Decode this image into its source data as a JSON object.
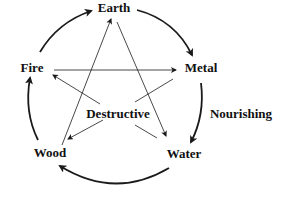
{
  "diagram": {
    "type": "five-elements-cycle",
    "nodes": [
      {
        "id": "earth",
        "label": "Earth",
        "x": 114,
        "y": 8
      },
      {
        "id": "fire",
        "label": "Fire",
        "x": 32,
        "y": 68
      },
      {
        "id": "metal",
        "label": "Metal",
        "x": 201,
        "y": 68
      },
      {
        "id": "wood",
        "label": "Wood",
        "x": 50,
        "y": 153
      },
      {
        "id": "water",
        "label": "Water",
        "x": 184,
        "y": 154
      }
    ],
    "cycle_labels": {
      "destructive": "Destructive",
      "nourishing": "Nourishing"
    },
    "nourishing_edges": [
      {
        "from": "Fire",
        "to": "Earth"
      },
      {
        "from": "Earth",
        "to": "Metal"
      },
      {
        "from": "Metal",
        "to": "Water"
      },
      {
        "from": "Water",
        "to": "Wood"
      },
      {
        "from": "Wood",
        "to": "Fire"
      }
    ],
    "destructive_edges": [
      {
        "from": "Fire",
        "to": "Metal"
      },
      {
        "from": "Metal",
        "to": "Wood"
      },
      {
        "from": "Wood",
        "to": "Earth"
      },
      {
        "from": "Earth",
        "to": "Water"
      },
      {
        "from": "Water",
        "to": "Fire"
      }
    ],
    "colors": {
      "line": "#1a1a1a",
      "text": "#111111",
      "background": "#ffffff"
    }
  }
}
